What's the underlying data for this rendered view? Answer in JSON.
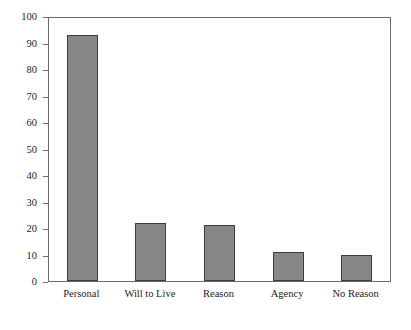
{
  "chart_data": {
    "type": "bar",
    "title": "",
    "subtitle": "",
    "xlabel": "",
    "ylabel": "",
    "categories": [
      "Personal",
      "Will to Live",
      "Reason",
      "Agency",
      "No Reason"
    ],
    "values": [
      93,
      22,
      21,
      11,
      10
    ],
    "series": [
      {
        "name": "Count",
        "values": [
          93,
          22,
          21,
          11,
          10
        ]
      }
    ],
    "ylim": [
      0,
      100
    ],
    "ytick_labels": [
      "0",
      "10",
      "20",
      "30",
      "40",
      "50",
      "60",
      "70",
      "80",
      "90",
      "100"
    ],
    "ytick_values": [
      0,
      10,
      20,
      30,
      40,
      50,
      60,
      70,
      80,
      90,
      100
    ],
    "grid": false,
    "legend": false,
    "legend_position": "none",
    "annotations": [],
    "colors": {
      "bar_fill": "#878787",
      "bar_edge": "#3d3d3d",
      "axis": "#6b6b6b",
      "text": "#1c1c1c",
      "background": "#ffffff"
    }
  }
}
